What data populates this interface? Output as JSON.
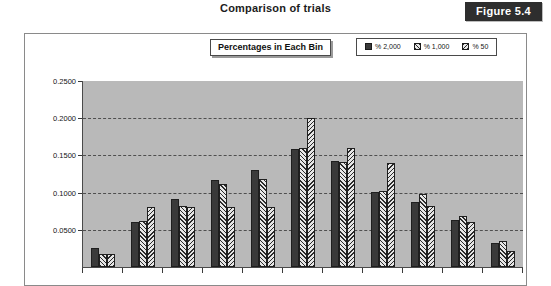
{
  "header": {
    "title": "Comparison of trials",
    "figure_badge": "Figure 5.4"
  },
  "plot": {
    "caption": "Percentages in Each Bin"
  },
  "legend": {
    "items": [
      {
        "label": "% 2,000",
        "pattern": "solid-dark",
        "color": "#3a3a3a"
      },
      {
        "label": "% 1,000",
        "pattern": "diagonal-hatch",
        "color": "#e6e6e6"
      },
      {
        "label": "% 50",
        "pattern": "diagonal-hatch-reverse",
        "color": "#e6e6e6"
      }
    ]
  },
  "chart_data": {
    "type": "bar",
    "title": "Percentages in Each Bin",
    "xlabel": "",
    "ylabel": "",
    "ylim": [
      0,
      0.25
    ],
    "grid": true,
    "legend_position": "top-right",
    "ytick_labels": [
      "0.2500",
      "0.2000",
      "0.1500",
      "0.1000",
      "0.0500"
    ],
    "ytick_values": [
      0.25,
      0.2,
      0.15,
      0.1,
      0.05
    ],
    "categories": [
      "1",
      "2",
      "3",
      "4",
      "5",
      "6",
      "7",
      "8",
      "9",
      "10",
      "11"
    ],
    "series": [
      {
        "name": "% 2,000",
        "values": [
          0.025,
          0.06,
          0.092,
          0.117,
          0.13,
          0.158,
          0.143,
          0.101,
          0.088,
          0.063,
          0.032
        ]
      },
      {
        "name": "% 1,000",
        "values": [
          0.018,
          0.062,
          0.082,
          0.112,
          0.118,
          0.16,
          0.141,
          0.102,
          0.098,
          0.068,
          0.035
        ]
      },
      {
        "name": "% 50",
        "values": [
          0.018,
          0.08,
          0.08,
          0.08,
          0.08,
          0.2,
          0.16,
          0.14,
          0.082,
          0.06,
          0.022
        ]
      }
    ]
  },
  "colors": {
    "plot_background": "#b9b9b9",
    "page_background": "#ffffff",
    "axis": "#4a4a4a",
    "badge_background": "#2e2e2e",
    "badge_text": "#ffffff"
  }
}
